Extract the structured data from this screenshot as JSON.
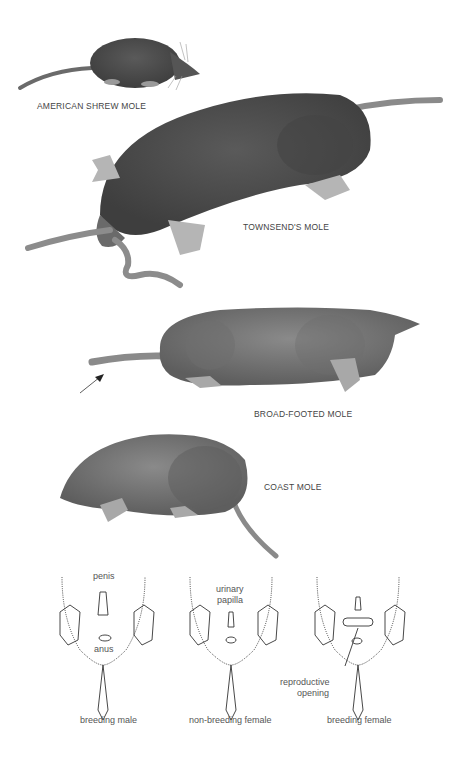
{
  "plate": {
    "species": [
      {
        "label": "AMERICAN SHREW MOLE"
      },
      {
        "label": "TOWNSEND'S MOLE"
      },
      {
        "label": "BROAD-FOOTED MOLE"
      },
      {
        "label": "COAST MOLE"
      }
    ],
    "diagrams": [
      {
        "caption": "breeding male",
        "annotations": [
          "penis",
          "anus"
        ]
      },
      {
        "caption": "non-breeding female",
        "annotations": [
          "urinary",
          "papilla"
        ]
      },
      {
        "caption": "breeding female",
        "annotations": [
          "reproductive",
          "opening"
        ]
      }
    ]
  },
  "colors": {
    "background": "#ffffff",
    "fur_dark": "#4a4a4a",
    "fur_mid": "#6e6e6e",
    "fur_light": "#9a9a9a",
    "line": "#333333"
  }
}
